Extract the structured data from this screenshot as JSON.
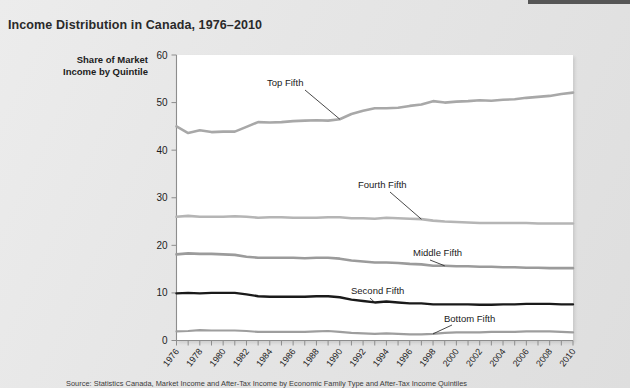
{
  "page": {
    "background_color": "#e9e9e9",
    "top_rule_color": "#565656"
  },
  "title": "Income Distribution in Canada, 1976–2010",
  "axis_title": {
    "line1": "Share of Market",
    "line2": "Income by Quintile"
  },
  "source_note": "Source: Statistics Canada, Market Income and After-Tax Income by Economic Family Type and After-Tax Income Quintiles",
  "chart_data": {
    "type": "line",
    "title": "Income Distribution in Canada, 1976–2010",
    "xlabel": "",
    "ylabel": "Share of Market Income by Quintile",
    "xlim": [
      1976,
      2010
    ],
    "ylim": [
      0,
      60
    ],
    "yticks": [
      0,
      10,
      20,
      30,
      40,
      50,
      60
    ],
    "grid": false,
    "legend": "inline-annotations",
    "x": [
      1976,
      1977,
      1978,
      1979,
      1980,
      1981,
      1982,
      1983,
      1984,
      1985,
      1986,
      1987,
      1988,
      1989,
      1990,
      1991,
      1992,
      1993,
      1994,
      1995,
      1996,
      1997,
      1998,
      1999,
      2000,
      2001,
      2002,
      2003,
      2004,
      2005,
      2006,
      2007,
      2008,
      2009,
      2010
    ],
    "xticks": [
      1976,
      1978,
      1980,
      1982,
      1984,
      1986,
      1988,
      1990,
      1992,
      1994,
      1996,
      1998,
      2000,
      2002,
      2004,
      2006,
      2008,
      2010
    ],
    "series": [
      {
        "name": "Top Fifth",
        "color": "#a8a8a8",
        "width": 2.6,
        "label": "Top Fifth",
        "values": [
          45.0,
          43.6,
          44.2,
          43.8,
          43.9,
          43.9,
          44.9,
          45.9,
          45.8,
          45.9,
          46.1,
          46.2,
          46.3,
          46.2,
          46.5,
          47.6,
          48.3,
          48.8,
          48.8,
          48.9,
          49.3,
          49.6,
          50.3,
          50.0,
          50.2,
          50.3,
          50.5,
          50.4,
          50.6,
          50.7,
          51.0,
          51.2,
          51.4,
          51.8,
          52.1
        ]
      },
      {
        "name": "Fourth Fifth",
        "color": "#b5b5b5",
        "width": 2.6,
        "label": "Fourth Fifth",
        "values": [
          26.0,
          26.2,
          26.0,
          26.0,
          26.0,
          26.1,
          26.0,
          25.8,
          25.9,
          25.9,
          25.8,
          25.8,
          25.8,
          25.9,
          25.9,
          25.7,
          25.7,
          25.6,
          25.8,
          25.7,
          25.6,
          25.5,
          25.2,
          25.0,
          24.9,
          24.8,
          24.7,
          24.7,
          24.7,
          24.7,
          24.7,
          24.6,
          24.6,
          24.6,
          24.6
        ]
      },
      {
        "name": "Middle Fifth",
        "color": "#9b9b9b",
        "width": 2.6,
        "label": "Middle Fifth",
        "values": [
          18.1,
          18.3,
          18.2,
          18.2,
          18.1,
          18.0,
          17.6,
          17.4,
          17.4,
          17.4,
          17.4,
          17.3,
          17.4,
          17.4,
          17.2,
          16.8,
          16.6,
          16.4,
          16.4,
          16.3,
          16.1,
          16.0,
          15.7,
          15.7,
          15.6,
          15.6,
          15.5,
          15.5,
          15.4,
          15.4,
          15.3,
          15.3,
          15.2,
          15.2,
          15.2
        ]
      },
      {
        "name": "Second Fifth",
        "color": "#1a1a1a",
        "width": 2.4,
        "label": "Second Fifth",
        "values": [
          9.9,
          10.0,
          9.9,
          10.0,
          10.0,
          10.0,
          9.7,
          9.3,
          9.2,
          9.2,
          9.2,
          9.2,
          9.3,
          9.3,
          9.1,
          8.6,
          8.3,
          8.0,
          8.2,
          8.0,
          7.8,
          7.8,
          7.6,
          7.6,
          7.6,
          7.6,
          7.5,
          7.5,
          7.6,
          7.6,
          7.7,
          7.7,
          7.7,
          7.6,
          7.6
        ]
      },
      {
        "name": "Bottom Fifth",
        "color": "#9e9e9e",
        "width": 2.2,
        "label": "Bottom Fifth",
        "values": [
          1.9,
          2.0,
          2.2,
          2.1,
          2.1,
          2.1,
          2.0,
          1.8,
          1.8,
          1.8,
          1.8,
          1.8,
          1.9,
          2.0,
          1.8,
          1.6,
          1.5,
          1.4,
          1.5,
          1.4,
          1.3,
          1.3,
          1.4,
          1.6,
          1.7,
          1.7,
          1.7,
          1.8,
          1.8,
          1.8,
          1.9,
          1.9,
          1.9,
          1.8,
          1.7
        ]
      }
    ]
  }
}
